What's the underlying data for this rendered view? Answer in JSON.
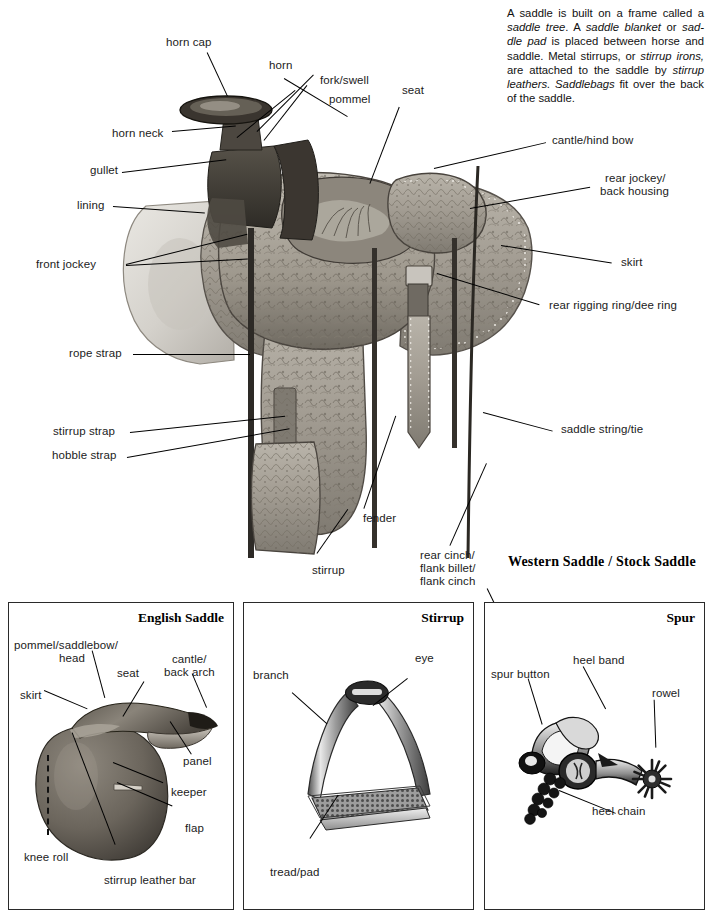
{
  "intro": {
    "segments": [
      {
        "t": "A saddle is built on a frame called a ",
        "i": false
      },
      {
        "t": "saddle tree",
        "i": true
      },
      {
        "t": ". A ",
        "i": false
      },
      {
        "t": "saddle blanket",
        "i": true
      },
      {
        "t": " or ",
        "i": false
      },
      {
        "t": "sad-dle pad",
        "i": true
      },
      {
        "t": " is placed between horse and saddle. Metal stirrups, or ",
        "i": false
      },
      {
        "t": "stirrup irons,",
        "i": true
      },
      {
        "t": " are attached to the saddle by ",
        "i": false
      },
      {
        "t": "stirrup leathers. Saddlebags",
        "i": true
      },
      {
        "t": " fit over the back of the saddle.",
        "i": false
      }
    ],
    "plain": "A saddle is built on a frame called a saddle tree. A saddle blanket or saddle pad is placed between horse and saddle. Metal stirrups, or stirrup irons, are attached to the saddle by stirrup leathers. Saddlebags fit over the back of the saddle."
  },
  "main": {
    "caption": "Western Saddle / Stock Saddle",
    "labels": {
      "horn_cap": "horn cap",
      "horn": "horn",
      "fork_swell": "fork/swell",
      "pommel": "pommel",
      "seat": "seat",
      "horn_neck": "horn neck",
      "gullet": "gullet",
      "lining": "lining",
      "front_jockey": "front jockey",
      "rope_strap": "rope strap",
      "stirrup_strap": "stirrup strap",
      "hobble_strap": "hobble strap",
      "stirrup": "stirrup",
      "fender": "fender",
      "rear_cinch_l1": "rear cinch/",
      "rear_cinch_l2": "flank billet/",
      "rear_cinch_l3": "flank cinch",
      "cantle_hind_bow": "cantle/hind bow",
      "rear_jockey_l1": "rear jockey/",
      "rear_jockey_l2": "back housing",
      "skirt": "skirt",
      "rear_rigging_ring": "rear rigging ring/dee ring",
      "saddle_string": "saddle string/tie"
    }
  },
  "panels": [
    {
      "id": "english-saddle",
      "title": "English Saddle",
      "labels": {
        "pommel_l1": "pommel/saddlebow/",
        "pommel_l2": "head",
        "seat": "seat",
        "cantle_l1": "cantle/",
        "cantle_l2": "back arch",
        "skirt": "skirt",
        "panel": "panel",
        "keeper": "keeper",
        "flap": "flap",
        "knee_roll": "knee roll",
        "stirrup_leather_bar": "stirrup leather bar"
      }
    },
    {
      "id": "stirrup",
      "title": "Stirrup",
      "labels": {
        "eye": "eye",
        "branch": "branch",
        "tread_pad": "tread/pad"
      }
    },
    {
      "id": "spur",
      "title": "Spur",
      "labels": {
        "spur_button": "spur button",
        "heel_band": "heel band",
        "rowel": "rowel",
        "heel_chain": "heel chain"
      }
    }
  ],
  "colors": {
    "ink": "#000000",
    "text": "#1b1b1b",
    "border": "#2a2a2a",
    "page_bg": "#ffffff",
    "leather_mid": "#9a958c",
    "leather_dark": "#4a4640",
    "leather_light": "#cfcac1",
    "metal_light": "#d8d8d8",
    "metal_dark": "#5a5a5a"
  }
}
